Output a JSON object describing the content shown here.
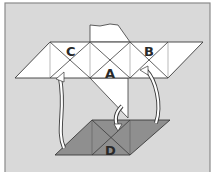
{
  "diagram": {
    "type": "folding-net",
    "labels": {
      "a": "A",
      "b": "B",
      "c": "C",
      "d": "D"
    },
    "colors": {
      "background": "#d9d9d9",
      "frame": "#8a8a8a",
      "net_fill": "#ffffff",
      "base_fill": "#8f8f8f",
      "line": "#3a3a3a",
      "arrow_fill": "#ffffff"
    },
    "arrows": [
      {
        "from": "base-left",
        "to": "net-under-C"
      },
      {
        "from": "base-top-middle",
        "to": "net-lower-flap"
      },
      {
        "from": "base-right",
        "to": "net-under-B"
      }
    ]
  }
}
